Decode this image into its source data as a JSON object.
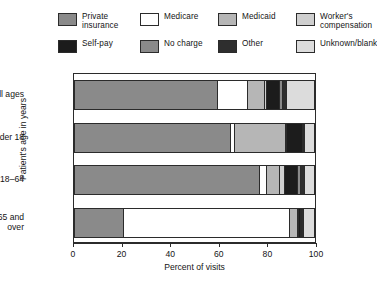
{
  "chart_data": {
    "type": "bar",
    "orientation": "horizontal",
    "stacked": true,
    "stacked_mode": "percent",
    "title": "",
    "xlabel": "Percent of visits",
    "ylabel": "Patient's age in years",
    "xlim": [
      0,
      100
    ],
    "xticks": [
      0,
      20,
      40,
      60,
      80,
      100
    ],
    "xtick_labels": [
      "0",
      "20",
      "40",
      "60",
      "80",
      "100"
    ],
    "grid": false,
    "legend_position": "top",
    "categories": [
      "All ages",
      "Under 18",
      "18–64",
      "65 and over"
    ],
    "series": [
      {
        "name": "Private insurance",
        "color": "#8a8a8a",
        "values": [
          59.5,
          65.0,
          77.0,
          20.0
        ]
      },
      {
        "name": "Medicare",
        "color": "#ffffff",
        "values": [
          12.5,
          1.5,
          3.0,
          69.5
        ]
      },
      {
        "name": "Medicaid",
        "color": "#b6b6b6",
        "values": [
          7.0,
          21.5,
          5.5,
          3.5
        ]
      },
      {
        "name": "Worker's compensation",
        "color": "#cfcfcf",
        "values": [
          1.0,
          0.5,
          2.0,
          0.5
        ]
      },
      {
        "name": "Self-pay",
        "color": "#1c1c1c",
        "values": [
          5.5,
          6.5,
          5.5,
          0.5
        ]
      },
      {
        "name": "No charge",
        "color": "#8a8a8a",
        "values": [
          1.0,
          0.5,
          1.0,
          0.5
        ]
      },
      {
        "name": "Other",
        "color": "#2e2e2e",
        "values": [
          2.0,
          0.5,
          2.0,
          1.0
        ]
      },
      {
        "name": "Unknown/blank",
        "color": "#dcdcdc",
        "values": [
          11.5,
          4.0,
          4.0,
          4.5
        ]
      }
    ]
  },
  "legend": {
    "items": [
      {
        "label": "Private\ninsurance",
        "swatch": "#8a8a8a",
        "icon": "legend-swatch-private-insurance"
      },
      {
        "label": "Medicare",
        "swatch": "#ffffff",
        "icon": "legend-swatch-medicare"
      },
      {
        "label": "Medicaid",
        "swatch": "#b6b6b6",
        "icon": "legend-swatch-medicaid"
      },
      {
        "label": "Worker's\ncompensation",
        "swatch": "#cfcfcf",
        "icon": "legend-swatch-workers-compensation"
      },
      {
        "label": "Self-pay",
        "swatch": "#1c1c1c",
        "icon": "legend-swatch-self-pay"
      },
      {
        "label": "No charge",
        "swatch": "#8a8a8a",
        "icon": "legend-swatch-no-charge"
      },
      {
        "label": "Other",
        "swatch": "#2e2e2e",
        "icon": "legend-swatch-other"
      },
      {
        "label": "Unknown/blank",
        "swatch": "#dcdcdc",
        "icon": "legend-swatch-unknown-blank"
      }
    ]
  },
  "axes": {
    "x_title": "Percent of visits",
    "y_title": "Patient's age in years",
    "x_tick_labels": [
      "0",
      "20",
      "40",
      "60",
      "80",
      "100"
    ],
    "y_tick_labels": [
      "All ages",
      "Under 18",
      "18–64",
      "65 and\nover"
    ]
  }
}
